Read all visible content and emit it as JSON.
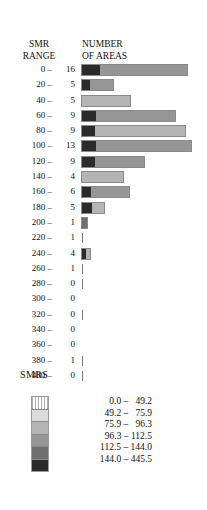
{
  "header": {
    "left_line1": "SMR",
    "left_line2": "RANGE",
    "right_line1": "NUMBER",
    "right_line2": "OF AREAS"
  },
  "legend": {
    "title": "SMRS",
    "entries": [
      {
        "label": "  0.0 –   49.2",
        "color": "#ffffff"
      },
      {
        "label": " 49.2 –   75.9",
        "color": "#dcdcdc"
      },
      {
        "label": " 75.9 –   96.3",
        "color": "#b4b4b4"
      },
      {
        "label": " 96.3 – 112.5",
        "color": "#969696"
      },
      {
        "label": "112.5 – 144.0",
        "color": "#6e6e6e"
      },
      {
        "label": "144.0 – 445.5",
        "color": "#2b2b2b"
      }
    ]
  },
  "chart_data": {
    "type": "bar",
    "title": "NUMBER OF AREAS",
    "xlabel": "NUMBER OF AREAS",
    "ylabel": "SMR RANGE",
    "grid": false,
    "legend_position": "bottom",
    "categories": [
      "0 –",
      "20 –",
      "40 –",
      "60 –",
      "80 –",
      "100 –",
      "120 –",
      "140 –",
      "160 –",
      "180 –",
      "200 –",
      "220 –",
      "240 –",
      "260 –",
      "280 –",
      "300 –",
      "320 –",
      "340 –",
      "360 –",
      "380 –",
      "400 –"
    ],
    "values": [
      16,
      5,
      5,
      9,
      9,
      13,
      9,
      4,
      6,
      5,
      1,
      1,
      4,
      1,
      0,
      0,
      0,
      0,
      0,
      1,
      0
    ],
    "bar_px_width": [
      105,
      31,
      48,
      93,
      103,
      109,
      62,
      41,
      47,
      22,
      5,
      1,
      8,
      1,
      1,
      0,
      1,
      0,
      0,
      1,
      1
    ],
    "segments": [
      [
        {
          "color": "#2b2b2b",
          "w": 18
        },
        {
          "color": "#969696",
          "w": 87
        }
      ],
      [
        {
          "color": "#2b2b2b",
          "w": 8
        },
        {
          "color": "#969696",
          "w": 23
        }
      ],
      [
        {
          "color": "#b4b4b4",
          "w": 48
        }
      ],
      [
        {
          "color": "#2b2b2b",
          "w": 14
        },
        {
          "color": "#969696",
          "w": 79
        }
      ],
      [
        {
          "color": "#2b2b2b",
          "w": 13
        },
        {
          "color": "#b4b4b4",
          "w": 90
        }
      ],
      [
        {
          "color": "#2b2b2b",
          "w": 14
        },
        {
          "color": "#969696",
          "w": 95
        }
      ],
      [
        {
          "color": "#2b2b2b",
          "w": 13
        },
        {
          "color": "#969696",
          "w": 49
        }
      ],
      [
        {
          "color": "#b4b4b4",
          "w": 41
        }
      ],
      [
        {
          "color": "#2b2b2b",
          "w": 9
        },
        {
          "color": "#969696",
          "w": 38
        }
      ],
      [
        {
          "color": "#2b2b2b",
          "w": 10
        },
        {
          "color": "#b4b4b4",
          "w": 12
        }
      ],
      [
        {
          "color": "#6e6e6e",
          "w": 5
        }
      ],
      [
        {
          "color": "#7a7a7a",
          "w": 1
        }
      ],
      [
        {
          "color": "#2b2b2b",
          "w": 4
        },
        {
          "color": "#b4b4b4",
          "w": 4
        }
      ],
      [
        {
          "color": "#7a7a7a",
          "w": 1
        }
      ],
      [
        {
          "color": "#7a7a7a",
          "w": 1
        }
      ],
      [],
      [
        {
          "color": "#7a7a7a",
          "w": 1
        }
      ],
      [],
      [],
      [
        {
          "color": "#7a7a7a",
          "w": 1
        }
      ],
      [
        {
          "color": "#7a7a7a",
          "w": 1
        }
      ]
    ]
  }
}
